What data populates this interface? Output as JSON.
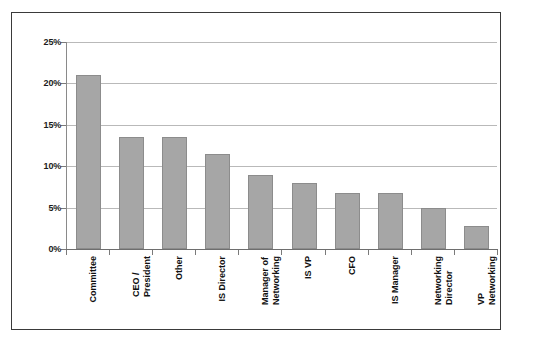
{
  "chart_data": {
    "type": "bar",
    "title": "",
    "subtitle": "",
    "xlabel": "",
    "ylabel": "",
    "categories": [
      "Committee",
      "CEO / President",
      "Other",
      "IS Director",
      "Manager of Networking",
      "IS VP",
      "CFO",
      "IS Manager",
      "Networking Director",
      "VP Networking"
    ],
    "category_lines": [
      [
        "Committee"
      ],
      [
        "CEO /",
        "President"
      ],
      [
        "Other"
      ],
      [
        "IS Director"
      ],
      [
        "Manager of",
        "Networking"
      ],
      [
        "IS VP"
      ],
      [
        "CFO"
      ],
      [
        "IS Manager"
      ],
      [
        "Networking",
        "Director"
      ],
      [
        "VP",
        "Networking"
      ]
    ],
    "values": [
      21.0,
      13.5,
      13.5,
      11.5,
      9.0,
      8.0,
      6.8,
      6.8,
      5.0,
      2.8
    ],
    "value_unit": "%",
    "ylim": [
      0,
      25
    ],
    "ytick_values": [
      0,
      5,
      10,
      15,
      20,
      25
    ],
    "ytick_labels": [
      "0%",
      "5%",
      "10%",
      "15%",
      "20%",
      "25%"
    ],
    "grid": true,
    "grid_axis": "y",
    "legend": false,
    "legend_position": "none",
    "series": [
      {
        "name": "Share of respondents",
        "color": "#a6a6a6",
        "border_color": "#8c8c8c",
        "values": [
          21.0,
          13.5,
          13.5,
          11.5,
          9.0,
          8.0,
          6.8,
          6.8,
          5.0,
          2.8
        ]
      }
    ]
  },
  "colors": {
    "bar_fill": "#a6a6a6",
    "bar_border": "#8c8c8c",
    "gridline": "#b9b9b9",
    "axis": "#7a7a7a",
    "frame": "#3a3a3a",
    "text": "#111111",
    "background": "#ffffff"
  }
}
